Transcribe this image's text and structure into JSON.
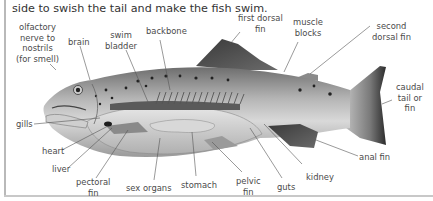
{
  "intro_text": "side to swish the tail and make the fish swim.",
  "diagram": {
    "labels": {
      "olfactory": [
        "olfactory",
        "nerve to",
        "nostrils",
        "(for smell)"
      ],
      "brain": [
        "brain"
      ],
      "swim_bladder": [
        "swim",
        "bladder"
      ],
      "backbone": [
        "backbone"
      ],
      "first_dorsal_fin": [
        "first dorsal",
        "fin"
      ],
      "muscle_blocks": [
        "muscle",
        "blocks"
      ],
      "second_dorsal_fin": [
        "second",
        "dorsal fin"
      ],
      "caudal_fin": [
        "caudal",
        "tail or",
        "fin"
      ],
      "gills": [
        "gills"
      ],
      "heart": [
        "heart"
      ],
      "liver": [
        "liver"
      ],
      "pectoral_fin": [
        "pectoral",
        "fin"
      ],
      "sex_organs": [
        "sex organs"
      ],
      "stomach": [
        "stomach"
      ],
      "pelvic_fin": [
        "pelvic",
        "fin"
      ],
      "guts": [
        "guts"
      ],
      "kidney": [
        "kidney"
      ],
      "anal_fin": [
        "anal fin"
      ]
    }
  }
}
